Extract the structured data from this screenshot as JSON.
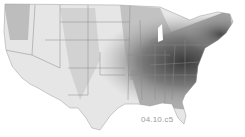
{
  "map": {
    "title": "",
    "region": "Contiguous United States",
    "style": "grayscale choropleth with state borders",
    "colors": {
      "light": "#e8e8e8",
      "mid": "#b8b8b8",
      "dark": "#6a6a6a",
      "darkest": "#3a3a3a",
      "border": "#888888"
    },
    "label": "04.10.c5"
  }
}
